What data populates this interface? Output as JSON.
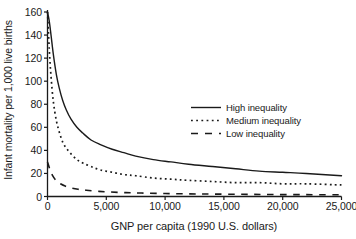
{
  "chart_data": {
    "type": "line",
    "title": "",
    "xlabel": "GNP per capita (1990 U.S. dollars)",
    "ylabel": "Infant mortality per 1,000 live births",
    "xlim": [
      0,
      25000
    ],
    "ylim": [
      0,
      160
    ],
    "xticks": [
      0,
      5000,
      10000,
      15000,
      20000,
      25000
    ],
    "xtick_labels": [
      "0",
      "5,000",
      "10,000",
      "15,000",
      "20,000",
      "25,000"
    ],
    "yticks": [
      0,
      20,
      40,
      60,
      80,
      100,
      120,
      140,
      160
    ],
    "ytick_labels": [
      "0",
      "20",
      "40",
      "60",
      "80",
      "100",
      "120",
      "140",
      "160"
    ],
    "grid": false,
    "legend_position": "center-right",
    "series": [
      {
        "name": "High inequality",
        "style": "solid",
        "color": "#1a1a1a",
        "x": [
          0,
          150,
          300,
          500,
          750,
          1000,
          1300,
          1600,
          2000,
          2500,
          3000,
          3700,
          4500,
          5500,
          6500,
          7500,
          9000,
          10500,
          12000,
          14000,
          16000,
          18000,
          20000,
          22000,
          25000
        ],
        "y": [
          160,
          152,
          140,
          123,
          106,
          94,
          83,
          75,
          67,
          60,
          55,
          49,
          45,
          41,
          38,
          35,
          32,
          30,
          28,
          26,
          24,
          22,
          21,
          20,
          18
        ]
      },
      {
        "name": "Medium inequality",
        "style": "dotted",
        "color": "#1a1a1a",
        "x": [
          0,
          150,
          300,
          500,
          750,
          1000,
          1300,
          1600,
          2000,
          2500,
          3000,
          3700,
          4500,
          5500,
          6500,
          7500,
          9000,
          10500,
          12000,
          14000,
          16000,
          18000,
          20000,
          22000,
          25000
        ],
        "y": [
          160,
          128,
          104,
          82,
          66,
          56,
          47,
          42,
          37,
          32,
          29,
          26,
          23,
          21,
          19,
          18,
          16,
          15,
          14,
          13,
          12,
          12,
          11,
          11,
          10
        ]
      },
      {
        "name": "Low inequality",
        "style": "dashed",
        "color": "#1a1a1a",
        "x": [
          0,
          250,
          500,
          800,
          1100,
          1500,
          2000,
          2600,
          3300,
          4200,
          5200,
          6500,
          8000,
          10000,
          12000,
          14000,
          16500,
          19000,
          22000,
          25000
        ],
        "y": [
          30,
          22,
          17,
          13,
          11,
          9,
          7.5,
          6.3,
          5.4,
          4.6,
          4.0,
          3.4,
          3.0,
          2.6,
          2.3,
          2.1,
          1.9,
          1.7,
          1.6,
          1.5
        ]
      }
    ]
  },
  "legend": {
    "items": [
      {
        "label": "High inequality",
        "style": "solid"
      },
      {
        "label": "Medium inequality",
        "style": "dotted"
      },
      {
        "label": "Low inequality",
        "style": "dashed"
      }
    ]
  },
  "axes": {
    "x_title": "GNP per capita (1990 U.S. dollars)",
    "y_title": "Infant mortality per 1,000 live births"
  }
}
